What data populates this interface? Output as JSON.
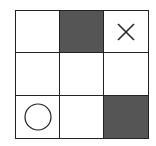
{
  "board": {
    "rows": 3,
    "cols": 3,
    "colors": {
      "dark": "#555555",
      "light": "#ffffff",
      "line": "#222222"
    },
    "cells": [
      {
        "row": 0,
        "col": 0,
        "shade": "light",
        "mark": ""
      },
      {
        "row": 0,
        "col": 1,
        "shade": "dark",
        "mark": ""
      },
      {
        "row": 0,
        "col": 2,
        "shade": "light",
        "mark": "X"
      },
      {
        "row": 1,
        "col": 0,
        "shade": "light",
        "mark": ""
      },
      {
        "row": 1,
        "col": 1,
        "shade": "light",
        "mark": ""
      },
      {
        "row": 1,
        "col": 2,
        "shade": "light",
        "mark": ""
      },
      {
        "row": 2,
        "col": 0,
        "shade": "light",
        "mark": "O"
      },
      {
        "row": 2,
        "col": 1,
        "shade": "light",
        "mark": ""
      },
      {
        "row": 2,
        "col": 2,
        "shade": "dark",
        "mark": ""
      }
    ]
  }
}
